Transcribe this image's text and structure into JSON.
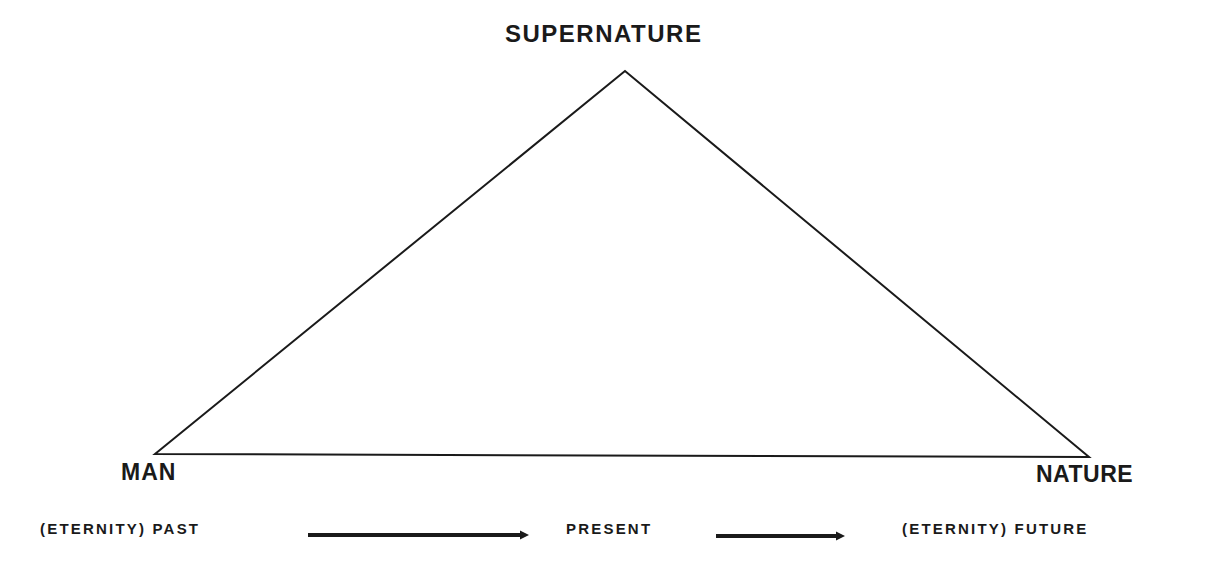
{
  "diagram": {
    "vertices": {
      "apex": {
        "label": "SUPERNATURE",
        "x": 625,
        "y": 71
      },
      "left": {
        "label": "MAN",
        "x": 155,
        "y": 454
      },
      "right": {
        "label": "NATURE",
        "x": 1089,
        "y": 457
      }
    },
    "timeline": {
      "past": "(ETERNITY) PAST",
      "present": "PRESENT",
      "future": "(ETERNITY) FUTURE",
      "arrows": [
        {
          "from": "past",
          "to": "present",
          "x1": 308,
          "x2": 528,
          "y": 535
        },
        {
          "from": "present",
          "to": "future",
          "x1": 716,
          "x2": 844,
          "y": 536
        }
      ]
    },
    "colors": {
      "stroke": "#1a1a1a",
      "background": "#ffffff"
    }
  }
}
